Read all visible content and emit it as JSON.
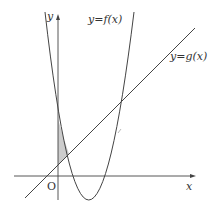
{
  "figure": {
    "type": "function-graph",
    "labels": {
      "y_axis": "y",
      "x_axis": "x",
      "origin": "O",
      "curve_f": "y=f(x)",
      "line_g": "y=g(x)"
    },
    "colors": {
      "axes": "#444444",
      "curves": "#444444",
      "shade": "#cccccc",
      "background": "#ffffff"
    },
    "shaded_region": "between y-axis, parabola y=f(x), and line y=g(x), left of their first intersection"
  }
}
